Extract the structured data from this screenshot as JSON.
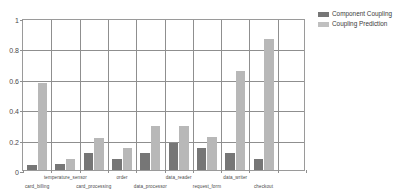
{
  "chart_data": {
    "type": "bar",
    "title": "",
    "xlabel": "",
    "ylabel": "",
    "ylim": [
      0,
      1
    ],
    "grid": true,
    "legend_position": "right",
    "categories": [
      "card_billing",
      "temperature_sensor",
      "card_processing",
      "order",
      "data_processor",
      "data_reader",
      "request_form",
      "data_writer",
      "checkout",
      ""
    ],
    "yticks": [
      "0",
      "0.2",
      "0.4",
      "0.6",
      "0.8",
      "1"
    ],
    "ytick_values": [
      0,
      0.2,
      0.4,
      0.6,
      0.8,
      1
    ],
    "series": [
      {
        "name": "Component Coupling",
        "color": "#767676",
        "values": [
          0.035,
          0.038,
          0.11,
          0.07,
          0.11,
          0.18,
          0.145,
          0.112,
          0.075,
          0.0
        ]
      },
      {
        "name": "Coupling Prediction",
        "color": "#b8b8b8",
        "values": [
          0.57,
          0.07,
          0.21,
          0.145,
          0.29,
          0.29,
          0.215,
          0.65,
          0.86,
          0.0
        ]
      }
    ]
  },
  "legend": {
    "items": [
      {
        "label": "Component Coupling",
        "swatch": "legend-swatch-dark"
      },
      {
        "label": "Coupling Prediction",
        "swatch": "legend-swatch-light"
      }
    ]
  },
  "axes": {
    "y_max_label": "1",
    "y_min_label": "0"
  }
}
